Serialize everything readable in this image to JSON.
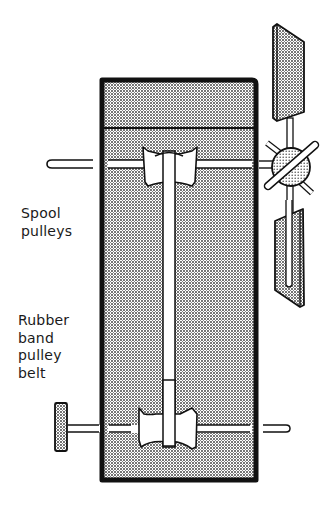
{
  "diagram": {
    "labels": {
      "spool_pulleys": [
        "Spool",
        "pulleys"
      ],
      "rubber_band_belt": [
        "Rubber",
        "band",
        "pulley",
        "belt"
      ]
    },
    "components": [
      "box-frame",
      "upper-axle",
      "upper-spool-pulley",
      "rubber-band-belt",
      "lower-axle",
      "lower-spool-pulley",
      "crank-knob",
      "fan-hub",
      "fan-blade-upper",
      "fan-blade-lower"
    ],
    "colors": {
      "ink": "#111111",
      "fill_dots": "#555555",
      "background": "#ffffff"
    }
  }
}
